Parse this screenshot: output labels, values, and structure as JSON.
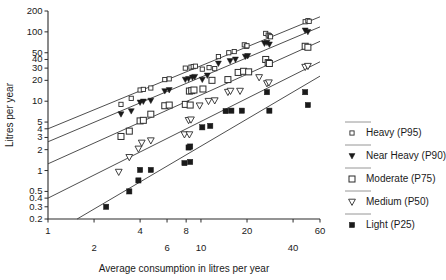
{
  "chart_data": {
    "type": "scatter",
    "title": "",
    "xlabel": "Average consumption in litres per year",
    "ylabel": "Litres per year",
    "xscale": "log",
    "yscale": "log",
    "xlim": [
      1,
      60
    ],
    "ylim": [
      0.2,
      200
    ],
    "grid": false,
    "legend_position": "right",
    "xticks": [
      1,
      2,
      4,
      6,
      8,
      10,
      20,
      40,
      60
    ],
    "xtick_labels": [
      "1",
      "2",
      "4",
      "6",
      "8",
      "10",
      "20",
      "40",
      "60"
    ],
    "xtick_rows": [
      0,
      1,
      0,
      1,
      0,
      1,
      0,
      1,
      0
    ],
    "yticks": [
      0.2,
      0.3,
      0.4,
      0.5,
      1,
      2,
      3,
      4,
      5,
      10,
      20,
      30,
      40,
      50,
      100,
      200
    ],
    "ytick_labels": [
      "0.2",
      "0.3",
      "0.4",
      "0.5",
      "1",
      "2",
      "3",
      "4",
      "5",
      "10",
      "20",
      "30",
      "40",
      "50",
      "100",
      "200"
    ],
    "series": [
      {
        "name": "Heavy (P95)",
        "marker": "open-square-small",
        "fit_line": {
          "x1": 1,
          "y1": 4.0,
          "x2": 60,
          "y2": 165
        },
        "points": [
          [
            3.0,
            9.0
          ],
          [
            3.5,
            11.0
          ],
          [
            4.0,
            14.5
          ],
          [
            4.2,
            14.8
          ],
          [
            4.7,
            15.5
          ],
          [
            5.8,
            20.5
          ],
          [
            6.2,
            21.0
          ],
          [
            7.9,
            30.0
          ],
          [
            8.6,
            31.0
          ],
          [
            8.9,
            31.5
          ],
          [
            9.2,
            32.0
          ],
          [
            10.2,
            29.0
          ],
          [
            11.3,
            30.5
          ],
          [
            12.3,
            29.5
          ],
          [
            13.0,
            44.0
          ],
          [
            15.2,
            50.0
          ],
          [
            16.5,
            52.0
          ],
          [
            19.2,
            65.0
          ],
          [
            19.8,
            62.0
          ],
          [
            20.0,
            63.0
          ],
          [
            26.5,
            95.0
          ],
          [
            27.5,
            90.0
          ],
          [
            28.0,
            88.0
          ],
          [
            28.5,
            85.0
          ],
          [
            48.0,
            140.0
          ],
          [
            50.0,
            145.0
          ],
          [
            51.0,
            142.0
          ]
        ]
      },
      {
        "name": "Near Heavy (P90)",
        "marker": "filled-triangle-down",
        "fit_line": {
          "x1": 1,
          "y1": 2.6,
          "x2": 60,
          "y2": 118
        },
        "points": [
          [
            3.0,
            6.5
          ],
          [
            3.5,
            7.2
          ],
          [
            4.0,
            9.6
          ],
          [
            4.2,
            9.9
          ],
          [
            4.7,
            10.2
          ],
          [
            5.8,
            14.0
          ],
          [
            6.2,
            14.5
          ],
          [
            7.9,
            20.5
          ],
          [
            8.3,
            21.0
          ],
          [
            8.8,
            22.0
          ],
          [
            9.1,
            22.5
          ],
          [
            10.2,
            20.5
          ],
          [
            11.0,
            23.5
          ],
          [
            13.0,
            35.0
          ],
          [
            15.5,
            38.0
          ],
          [
            16.8,
            40.0
          ],
          [
            19.5,
            44.0
          ],
          [
            20.2,
            45.0
          ],
          [
            26.0,
            68.0
          ],
          [
            27.0,
            70.0
          ],
          [
            28.0,
            66.0
          ],
          [
            48.0,
            105.0
          ],
          [
            50.0,
            100.0
          ]
        ]
      },
      {
        "name": "Moderate (P75)",
        "marker": "open-square",
        "fit_line": {
          "x1": 1,
          "y1": 1.25,
          "x2": 60,
          "y2": 73
        },
        "points": [
          [
            3.0,
            3.1
          ],
          [
            3.4,
            3.7
          ],
          [
            4.0,
            5.2
          ],
          [
            4.2,
            5.3
          ],
          [
            4.7,
            6.5
          ],
          [
            5.8,
            8.6
          ],
          [
            6.2,
            8.8
          ],
          [
            7.9,
            9.0
          ],
          [
            8.5,
            8.8
          ],
          [
            8.4,
            14.0
          ],
          [
            8.7,
            14.2
          ],
          [
            9.0,
            14.5
          ],
          [
            10.3,
            15.0
          ],
          [
            11.8,
            20.0
          ],
          [
            15.0,
            20.5
          ],
          [
            17.5,
            26.0
          ],
          [
            19.0,
            27.0
          ],
          [
            20.5,
            26.5
          ],
          [
            26.5,
            40.0
          ],
          [
            27.5,
            36.0
          ],
          [
            28.0,
            35.0
          ],
          [
            48.0,
            62.0
          ],
          [
            50.0,
            60.0
          ]
        ]
      },
      {
        "name": "Medium (P50)",
        "marker": "open-triangle-down",
        "fit_line": {
          "x1": 1.0,
          "y1": 0.4,
          "x2": 60,
          "y2": 37
        },
        "points": [
          [
            2.9,
            0.95
          ],
          [
            3.4,
            1.55
          ],
          [
            3.9,
            2.05
          ],
          [
            4.1,
            2.5
          ],
          [
            4.7,
            2.7
          ],
          [
            7.8,
            3.3
          ],
          [
            8.4,
            3.3
          ],
          [
            8.3,
            5.3
          ],
          [
            8.6,
            5.4
          ],
          [
            9.8,
            8.6
          ],
          [
            11.2,
            10.0
          ],
          [
            12.3,
            10.2
          ],
          [
            15.0,
            13.5
          ],
          [
            15.6,
            14.0
          ],
          [
            18.0,
            14.0
          ],
          [
            24.0,
            22.0
          ],
          [
            27.0,
            18.0
          ],
          [
            27.8,
            18.5
          ],
          [
            48.0,
            31.0
          ],
          [
            50.0,
            32.0
          ]
        ]
      },
      {
        "name": "Light (P25)",
        "marker": "filled-square",
        "fit_line": {
          "x1": 1.55,
          "y1": 0.2,
          "x2": 60,
          "y2": 23
        },
        "points": [
          [
            2.4,
            0.3
          ],
          [
            3.4,
            0.5
          ],
          [
            3.9,
            0.72
          ],
          [
            4.0,
            1.02
          ],
          [
            4.7,
            1.02
          ],
          [
            7.8,
            1.28
          ],
          [
            8.5,
            1.33
          ],
          [
            8.3,
            2.15
          ],
          [
            8.5,
            2.22
          ],
          [
            10.2,
            4.2
          ],
          [
            11.5,
            4.4
          ],
          [
            14.5,
            7.2
          ],
          [
            15.8,
            7.3
          ],
          [
            18.5,
            7.3
          ],
          [
            27.0,
            13.5
          ],
          [
            28.0,
            7.3
          ],
          [
            48.0,
            13.5
          ],
          [
            50.0,
            8.8
          ]
        ]
      }
    ]
  },
  "legend": {
    "entries": [
      {
        "label": "Heavy (P95)",
        "marker": "open-square-small"
      },
      {
        "label": "Near Heavy (P90)",
        "marker": "filled-triangle-down"
      },
      {
        "label": "Moderate (P75)",
        "marker": "open-square"
      },
      {
        "label": "Medium (P50)",
        "marker": "open-triangle-down"
      },
      {
        "label": "Light (P25)",
        "marker": "filled-square"
      }
    ]
  }
}
